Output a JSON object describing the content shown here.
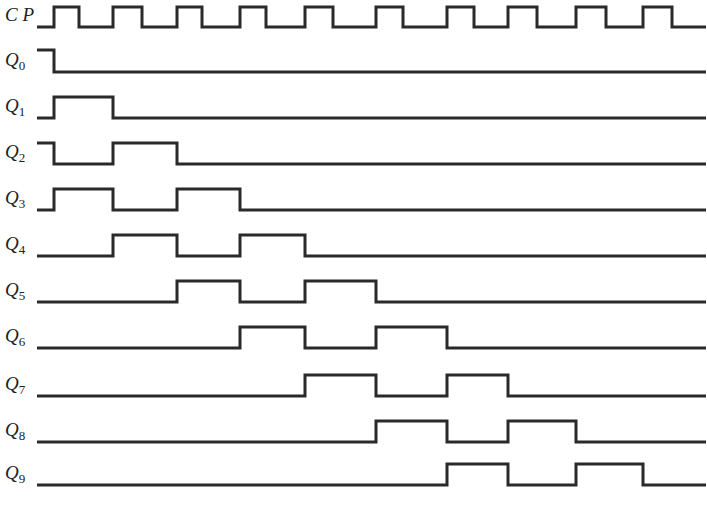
{
  "diagram": {
    "type": "timing-diagram",
    "x_start": 37,
    "x_end": 706,
    "clock_edges": [
      54,
      113,
      177,
      240,
      305,
      376,
      447,
      508,
      576,
      643
    ],
    "clock_falls": [
      79,
      142,
      202,
      266,
      333,
      403,
      474,
      537,
      606,
      672
    ],
    "signals": [
      {
        "name": "CP",
        "sub": "",
        "low_y": 27,
        "amp": 20,
        "label_y": 5,
        "kind": "clock"
      },
      {
        "name": "Q",
        "sub": "0",
        "low_y": 72,
        "amp": 22,
        "label_y": 50,
        "initial": 1,
        "high_intervals": [
          [
            -1,
            0
          ]
        ]
      },
      {
        "name": "Q",
        "sub": "1",
        "low_y": 118,
        "amp": 21,
        "label_y": 96,
        "initial": 0,
        "high_intervals": [
          [
            0,
            1
          ]
        ]
      },
      {
        "name": "Q",
        "sub": "2",
        "low_y": 164,
        "amp": 21,
        "label_y": 142,
        "initial": 1,
        "high_intervals": [
          [
            -1,
            0
          ],
          [
            1,
            2
          ]
        ]
      },
      {
        "name": "Q",
        "sub": "3",
        "low_y": 210,
        "amp": 21,
        "label_y": 188,
        "initial": 0,
        "high_intervals": [
          [
            0,
            1
          ],
          [
            2,
            3
          ]
        ]
      },
      {
        "name": "Q",
        "sub": "4",
        "low_y": 256,
        "amp": 21,
        "label_y": 234,
        "initial": 0,
        "high_intervals": [
          [
            1,
            2
          ],
          [
            3,
            4
          ]
        ]
      },
      {
        "name": "Q",
        "sub": "5",
        "low_y": 302,
        "amp": 21,
        "label_y": 280,
        "initial": 0,
        "high_intervals": [
          [
            2,
            3
          ],
          [
            4,
            5
          ]
        ]
      },
      {
        "name": "Q",
        "sub": "6",
        "low_y": 348,
        "amp": 21,
        "label_y": 326,
        "initial": 0,
        "high_intervals": [
          [
            3,
            4
          ],
          [
            5,
            6
          ]
        ]
      },
      {
        "name": "Q",
        "sub": "7",
        "low_y": 396,
        "amp": 21,
        "label_y": 374,
        "initial": 0,
        "high_intervals": [
          [
            4,
            5
          ],
          [
            6,
            7
          ]
        ]
      },
      {
        "name": "Q",
        "sub": "8",
        "low_y": 442,
        "amp": 21,
        "label_y": 420,
        "initial": 0,
        "high_intervals": [
          [
            5,
            6
          ],
          [
            7,
            8
          ]
        ]
      },
      {
        "name": "Q",
        "sub": "9",
        "low_y": 485,
        "amp": 21,
        "label_y": 463,
        "initial": 0,
        "high_intervals": [
          [
            6,
            7
          ],
          [
            8,
            9
          ]
        ]
      }
    ]
  }
}
